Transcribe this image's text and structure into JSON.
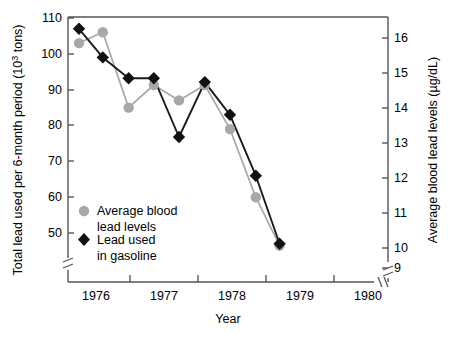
{
  "chart_data": {
    "type": "line",
    "title": "",
    "xlabel": "Year",
    "ylabel": "Total lead used per 6-month period (10³ tons)",
    "y2label": "Average blood lead levels (µg/dL)",
    "grid": false,
    "legend_position": "lower-left-inside",
    "xlim": [
      1975.5,
      1980.0
    ],
    "x_tick_labels": [
      "1976",
      "1977",
      "1978",
      "1979",
      "1980"
    ],
    "x_tick_values": [
      1976,
      1977,
      1978,
      1979,
      1980
    ],
    "ylim": [
      45,
      110
    ],
    "y_tick_labels": [
      "50",
      "60",
      "70",
      "80",
      "90",
      "100",
      "110"
    ],
    "y_tick_values": [
      50,
      60,
      70,
      80,
      90,
      100,
      110
    ],
    "y_axis_break": true,
    "y2lim": [
      9.35,
      16.7
    ],
    "y2_tick_labels": [
      "9",
      "10",
      "11",
      "12",
      "13",
      "14",
      "15",
      "16"
    ],
    "y2_tick_values": [
      9,
      10,
      11,
      12,
      13,
      14,
      15,
      16
    ],
    "y2_axis_break": true,
    "x_axis_break": true,
    "x": [
      1975.75,
      1976.1,
      1976.48,
      1976.85,
      1977.22,
      1977.6,
      1977.97,
      1978.35,
      1978.7
    ],
    "series": [
      {
        "name": "Average blood lead levels",
        "marker": "circle",
        "color": "#a8a8a8",
        "axis": "right",
        "values_right": [
          16.05,
          16.4,
          13.9,
          14.5,
          14.15,
          14.5,
          12.8,
          11.1,
          9.6
        ],
        "values_left_equivalent": [
          103,
          106,
          85,
          91.3,
          87,
          91.3,
          79,
          60,
          46.5
        ]
      },
      {
        "name": "Lead used in gasoline",
        "marker": "diamond",
        "color": "#111111",
        "axis": "left",
        "values_left": [
          107,
          99,
          93.2,
          93.2,
          76.8,
          92.1,
          83,
          66,
          47
        ]
      }
    ],
    "legend": [
      {
        "label_line1": "Average blood",
        "label_line2": "lead levels",
        "marker": "circle",
        "color": "#a8a8a8"
      },
      {
        "label_line1": "Lead used",
        "label_line2": "in gasoline",
        "marker": "diamond",
        "color": "#111111"
      }
    ]
  },
  "axes": {
    "left_title": "Total lead used per 6-month period (10³ tons)",
    "left_title_main": "Total lead used per 6-month period (10",
    "left_title_sup": "3",
    "left_title_tail": " tons)",
    "right_title": "Average blood lead levels (µg/dL)",
    "x_title": "Year"
  },
  "colors": {
    "gray_series": "#a8a8a8",
    "black_series": "#111111",
    "axis": "#555555",
    "background": "#ffffff"
  }
}
